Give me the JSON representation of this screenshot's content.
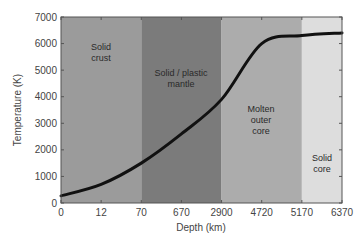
{
  "chart_data": {
    "type": "line",
    "title": "",
    "xlabel": "Depth (km)",
    "ylabel": "Temperature (K)",
    "ylim": [
      0,
      7000
    ],
    "yticks": [
      0,
      1000,
      2000,
      3000,
      4000,
      5000,
      6000,
      7000
    ],
    "xtick_labels": [
      "0",
      "12",
      "70",
      "670",
      "2900",
      "4720",
      "5170",
      "6370"
    ],
    "grid": false,
    "legend": null,
    "regions": [
      {
        "name": "Solid crust",
        "lines": [
          "Solid",
          "crust"
        ],
        "x_from": "0",
        "x_to": "70",
        "color": "#9b9b9b"
      },
      {
        "name": "Solid / plastic mantle",
        "lines": [
          "Solid / plastic",
          "mantle"
        ],
        "x_from": "70",
        "x_to": "2900",
        "color": "#7b7b7b"
      },
      {
        "name": "Molten outer core",
        "lines": [
          "Molten",
          "outer",
          "core"
        ],
        "x_from": "2900",
        "x_to": "5170",
        "color": "#acacac"
      },
      {
        "name": "Solid core",
        "lines": [
          "Solid",
          "core"
        ],
        "x_from": "5170",
        "x_to": "6370",
        "color": "#dddddd"
      }
    ],
    "series": [
      {
        "name": "Temperature",
        "x": [
          "0",
          "12",
          "70",
          "670",
          "2900",
          "4720",
          "5170",
          "6370"
        ],
        "values": [
          270,
          700,
          1500,
          2600,
          3900,
          6000,
          6300,
          6400
        ],
        "color": "#111111"
      }
    ]
  },
  "axes": {
    "xlabel": "Depth (km)",
    "ylabel": "Temperature (K)"
  }
}
